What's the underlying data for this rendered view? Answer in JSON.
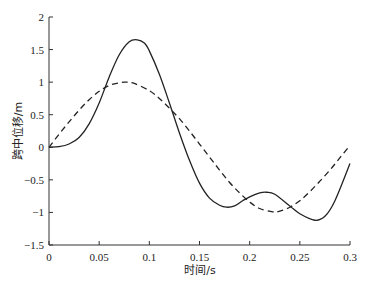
{
  "chart_data": {
    "type": "line",
    "title": "",
    "xlabel": "时间/s",
    "ylabel": "跨中位移/m",
    "xlim": [
      0,
      0.3
    ],
    "ylim": [
      -1.5,
      2
    ],
    "xticks": [
      0,
      0.05,
      0.1,
      0.15,
      0.2,
      0.25,
      0.3
    ],
    "xtick_labels": [
      "0",
      "0.05",
      "0.1",
      "0.15",
      "0.2",
      "0.25",
      "0.3"
    ],
    "yticks": [
      -1.5,
      -1,
      -0.5,
      0,
      0.5,
      1,
      1.5,
      2
    ],
    "ytick_labels": [
      "−1.5",
      "−1",
      "−0.5",
      "0",
      "0.5",
      "1",
      "1.5",
      "2"
    ],
    "grid": false,
    "legend": null,
    "series": [
      {
        "name": "solid",
        "style": "solid",
        "color": "#222222",
        "x": [
          0,
          0.01,
          0.02,
          0.03,
          0.04,
          0.05,
          0.06,
          0.07,
          0.08,
          0.088,
          0.095,
          0.1,
          0.11,
          0.12,
          0.13,
          0.14,
          0.15,
          0.16,
          0.17,
          0.177,
          0.185,
          0.193,
          0.2,
          0.21,
          0.217,
          0.225,
          0.24,
          0.25,
          0.265,
          0.275,
          0.285,
          0.3
        ],
        "y": [
          0,
          0.01,
          0.05,
          0.15,
          0.36,
          0.68,
          1.08,
          1.42,
          1.62,
          1.65,
          1.6,
          1.48,
          1.12,
          0.68,
          0.22,
          -0.2,
          -0.55,
          -0.78,
          -0.89,
          -0.92,
          -0.9,
          -0.82,
          -0.76,
          -0.7,
          -0.69,
          -0.72,
          -0.9,
          -1.02,
          -1.12,
          -1.06,
          -0.82,
          -0.25
        ]
      },
      {
        "name": "dashed",
        "style": "dashed",
        "color": "#222222",
        "x": [
          0,
          0.01,
          0.02,
          0.03,
          0.04,
          0.05,
          0.06,
          0.07,
          0.076,
          0.085,
          0.1,
          0.11,
          0.12,
          0.13,
          0.14,
          0.15,
          0.16,
          0.17,
          0.18,
          0.19,
          0.2,
          0.21,
          0.223,
          0.23,
          0.24,
          0.25,
          0.26,
          0.27,
          0.28,
          0.29,
          0.3
        ],
        "y": [
          0,
          0.2,
          0.39,
          0.57,
          0.73,
          0.86,
          0.95,
          0.99,
          1.0,
          0.98,
          0.87,
          0.75,
          0.6,
          0.44,
          0.25,
          0.05,
          -0.15,
          -0.35,
          -0.54,
          -0.7,
          -0.84,
          -0.94,
          -0.99,
          -0.98,
          -0.92,
          -0.82,
          -0.68,
          -0.52,
          -0.35,
          -0.16,
          0.03
        ]
      }
    ]
  }
}
